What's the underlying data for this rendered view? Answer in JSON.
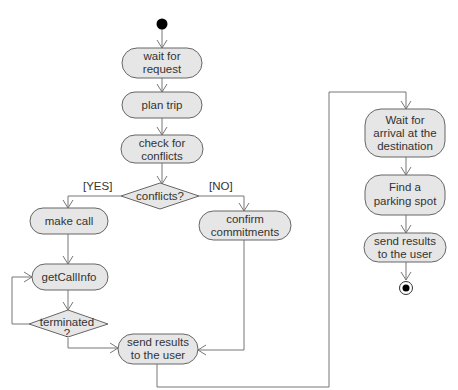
{
  "diagram": {
    "type": "UML activity diagram",
    "colors": {
      "node_fill": "#e6e6e6",
      "node_stroke": "#666666",
      "edge": "#777777",
      "text": "#333333",
      "start": "#000000"
    },
    "nodes": {
      "wait_for_request": [
        "wait for",
        "request"
      ],
      "plan_trip": [
        "plan trip"
      ],
      "check_conflicts": [
        "check for",
        "conflicts"
      ],
      "conflicts_decision": [
        "conflicts?"
      ],
      "make_call": [
        "make call"
      ],
      "confirm_commitments": [
        "confirm",
        "commitments"
      ],
      "get_call_info": [
        "getCallInfo"
      ],
      "terminated_decision": [
        "terminated",
        "?"
      ],
      "send_results_1": [
        "send results",
        "to the user"
      ],
      "wait_arrival": [
        "Wait for",
        "arrival at the",
        "destination"
      ],
      "find_parking": [
        "Find a",
        "parking spot"
      ],
      "send_results_2": [
        "send results",
        "to the user"
      ]
    },
    "guards": {
      "yes": "[YES]",
      "no": "[NO]"
    }
  }
}
